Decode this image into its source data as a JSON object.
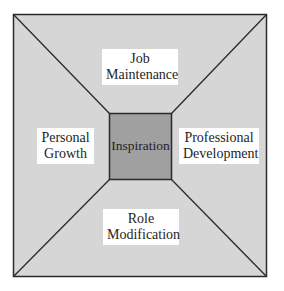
{
  "diagram": {
    "colors": {
      "outer_fill": "#d6d6d6",
      "inner_fill": "#a0a0a0",
      "stroke": "#2a2a2a",
      "label_bg": "#ffffff"
    },
    "center": {
      "label": "Inspiration"
    },
    "regions": {
      "top": {
        "line1": "Job",
        "line2": "Maintenance"
      },
      "left": {
        "line1": "Personal",
        "line2": "Growth"
      },
      "right": {
        "line1": "Professional",
        "line2": "Development"
      },
      "bottom": {
        "line1": "Role",
        "line2": "Modification"
      }
    }
  }
}
